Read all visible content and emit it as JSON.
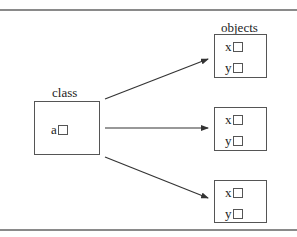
{
  "diagram": {
    "class_box": {
      "title": "class",
      "fields": [
        {
          "name": "a"
        }
      ]
    },
    "objects_title": "objects",
    "objects": [
      {
        "fields": [
          {
            "name": "x"
          },
          {
            "name": "y"
          }
        ]
      },
      {
        "fields": [
          {
            "name": "x"
          },
          {
            "name": "y"
          }
        ]
      },
      {
        "fields": [
          {
            "name": "x"
          },
          {
            "name": "y"
          }
        ]
      }
    ],
    "arrows": [
      {
        "from": "class",
        "to": "object-1"
      },
      {
        "from": "class",
        "to": "object-2"
      },
      {
        "from": "class",
        "to": "object-3"
      }
    ],
    "colors": {
      "line": "#555555",
      "rule": "#8a8a8a",
      "arrow": "#333333"
    }
  }
}
